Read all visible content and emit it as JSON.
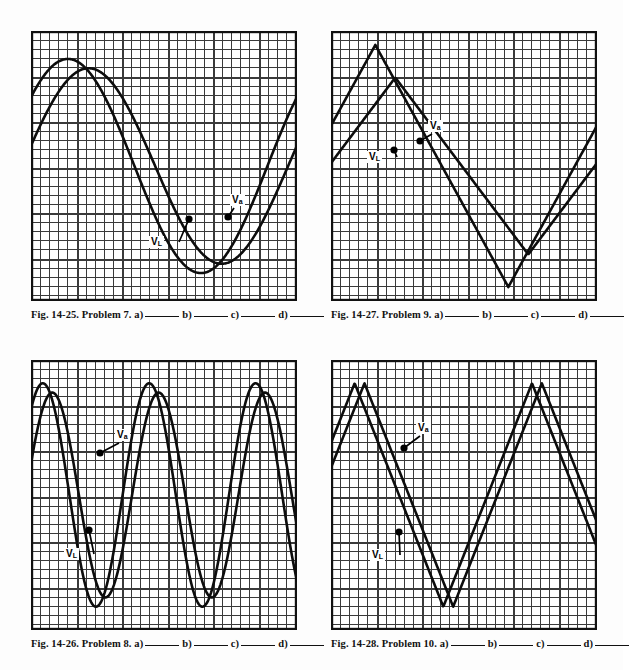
{
  "page": {
    "background": "#fdfdfd",
    "ink": "#111111",
    "grid_color": "#3a3a3a",
    "width": 623,
    "height": 670
  },
  "panels": [
    {
      "id": "panel-1",
      "caption": {
        "fig": "Fig. 14-25.",
        "problem": "Problem 7.",
        "parts": [
          "a)",
          "b)",
          "c)",
          "d)"
        ]
      },
      "grid": {
        "cols": 29,
        "rows": 29,
        "cell": 9.1
      },
      "chart_index": 0
    },
    {
      "id": "panel-2",
      "caption": {
        "fig": "Fig. 14-27.",
        "problem": "Problem 9.",
        "parts": [
          "a)",
          "b)",
          "c)",
          "d)"
        ]
      },
      "grid": {
        "cols": 29,
        "rows": 29,
        "cell": 9.1
      },
      "chart_index": 1
    },
    {
      "id": "panel-3",
      "caption": {
        "fig": "Fig. 14-26.",
        "problem": "Problem 8.",
        "parts": [
          "a)",
          "b)",
          "c)",
          "d)"
        ]
      },
      "grid": {
        "cols": 29,
        "rows": 29,
        "cell": 9.1
      },
      "chart_index": 2
    },
    {
      "id": "panel-4",
      "caption": {
        "fig": "Fig. 14-28.",
        "problem": "Problem 10.",
        "parts": [
          "a)",
          "b)",
          "c)",
          "d)"
        ]
      },
      "grid": {
        "cols": 29,
        "rows": 29,
        "cell": 9.1
      },
      "chart_index": 3
    }
  ],
  "labels": {
    "v_a_main": "V",
    "v_a_sub": "a",
    "v_l_main": "V",
    "v_l_sub": "L"
  },
  "chart_data": [
    {
      "type": "line",
      "title": "Fig. 14-25. Problem 7.",
      "xlabel": "",
      "ylabel": "",
      "grid": true,
      "legend": "inline-callout",
      "xlim": [
        0,
        29
      ],
      "ylim": [
        -14.5,
        14.5
      ],
      "waveform": "sine",
      "series": [
        {
          "name": "V_L",
          "shape": "sine",
          "amplitude": 11.5,
          "periods": 1.0,
          "phase_deg": 40,
          "offset": 0,
          "callout_label": "V_L",
          "callout_x_px": 118,
          "callout_y_px": 205,
          "dot_x_px": 158,
          "dot_y_px": 188
        },
        {
          "name": "V_a",
          "shape": "sine",
          "amplitude": 10.5,
          "periods": 1.0,
          "phase_deg": 12,
          "offset": 0,
          "callout_label": "V_a",
          "callout_x_px": 199,
          "callout_y_px": 163,
          "dot_x_px": 197,
          "dot_y_px": 186
        }
      ]
    },
    {
      "type": "line",
      "title": "Fig. 14-27. Problem 9.",
      "xlabel": "",
      "ylabel": "",
      "grid": true,
      "legend": "inline-callout",
      "xlim": [
        0,
        29
      ],
      "ylim": [
        -14.5,
        14.5
      ],
      "waveform": "triangle",
      "series": [
        {
          "name": "V_L",
          "shape": "triangle",
          "amplitude": 13.0,
          "periods": 1.0,
          "phase_deg": 30,
          "offset": 0,
          "callout_label": "V_L",
          "callout_x_px": 36,
          "callout_y_px": 120,
          "dot_x_px": 63,
          "dot_y_px": 119
        },
        {
          "name": "V_a",
          "shape": "triangle",
          "amplitude": 9.5,
          "periods": 1.0,
          "phase_deg": 3,
          "offset": 0,
          "callout_label": "V_a",
          "callout_x_px": 97,
          "callout_y_px": 89,
          "dot_x_px": 89,
          "dot_y_px": 110
        }
      ]
    },
    {
      "type": "line",
      "title": "Fig. 14-26. Problem 8.",
      "xlabel": "",
      "ylabel": "",
      "grid": true,
      "legend": "inline-callout",
      "xlim": [
        0,
        29
      ],
      "ylim": [
        -14.5,
        14.5
      ],
      "waveform": "sine",
      "series": [
        {
          "name": "V_L",
          "shape": "sine",
          "amplitude": 12.0,
          "periods": 2.5,
          "phase_deg": 50,
          "offset": 0,
          "callout_label": "V_L",
          "callout_x_px": 33,
          "callout_y_px": 188,
          "dot_x_px": 58,
          "dot_y_px": 170
        },
        {
          "name": "V_a",
          "shape": "sine",
          "amplitude": 11.0,
          "periods": 2.5,
          "phase_deg": 18,
          "offset": 0,
          "callout_label": "V_a",
          "callout_x_px": 84,
          "callout_y_px": 69,
          "dot_x_px": 69,
          "dot_y_px": 93
        }
      ]
    },
    {
      "type": "line",
      "title": "Fig. 14-28. Problem 10.",
      "xlabel": "",
      "ylabel": "",
      "grid": true,
      "legend": "inline-callout",
      "xlim": [
        0,
        29
      ],
      "ylim": [
        -14.5,
        14.5
      ],
      "waveform": "triangle",
      "series": [
        {
          "name": "V_L",
          "shape": "triangle",
          "amplitude": 12.0,
          "periods": 1.5,
          "phase_deg": 42,
          "offset": 0,
          "callout_label": "V_L",
          "callout_x_px": 39,
          "callout_y_px": 189,
          "dot_x_px": 68,
          "dot_y_px": 172
        },
        {
          "name": "V_a",
          "shape": "triangle",
          "amplitude": 12.0,
          "periods": 1.5,
          "phase_deg": 22,
          "offset": 0,
          "callout_label": "V_a",
          "callout_x_px": 85,
          "callout_y_px": 62,
          "dot_x_px": 73,
          "dot_y_px": 88
        }
      ]
    }
  ]
}
